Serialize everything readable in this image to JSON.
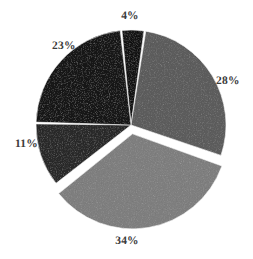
{
  "chart_data": {
    "type": "pie",
    "title": "",
    "subtitle": "",
    "xlabel": "",
    "ylabel": "",
    "legend": "none",
    "grid": false,
    "background_color": "#ffffff",
    "label_color": "#3b3b3b",
    "label_format": "percent",
    "total": 100,
    "categories": [
      "Slice 1",
      "Slice 2",
      "Slice 3",
      "Slice 4",
      "Slice 5"
    ],
    "values": [
      4,
      28,
      34,
      11,
      23
    ],
    "slices": [
      {
        "label": "4%",
        "value": 4,
        "color": "#121212",
        "exploded": false,
        "start_angle_deg": 354,
        "end_angle_deg": 368.4
      },
      {
        "label": "28%",
        "value": 28,
        "color": "#5c5c5c",
        "exploded": false,
        "start_angle_deg": 8.4,
        "end_angle_deg": 109.2
      },
      {
        "label": "34%",
        "value": 34,
        "color": "#7e7e7e",
        "exploded": true,
        "start_angle_deg": 109.2,
        "end_angle_deg": 231.6
      },
      {
        "label": "11%",
        "value": 11,
        "color": "#292929",
        "exploded": false,
        "start_angle_deg": 231.6,
        "end_angle_deg": 271.2
      },
      {
        "label": "23%",
        "value": 23,
        "color": "#151515",
        "exploded": false,
        "start_angle_deg": 271.2,
        "end_angle_deg": 354
      }
    ]
  },
  "labels": {
    "top": "4%",
    "upper_left": "23%",
    "right": "28%",
    "left": "11%",
    "bottom": "34%"
  },
  "geometry": {
    "center_x": 131,
    "center_y": 125,
    "radius": 95,
    "explode_offset": 9,
    "gap_color": "#ffffff"
  }
}
